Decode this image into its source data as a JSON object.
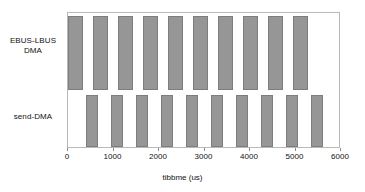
{
  "chart_data": {
    "type": "bar",
    "orientation": "horizontal-gantt",
    "title": "",
    "xlabel": "tibbme (us)",
    "ylabel": "",
    "xlim": [
      0,
      6000
    ],
    "xticks": [
      0,
      1000,
      2000,
      3000,
      4000,
      5000,
      6000
    ],
    "xticklabels": [
      "0",
      "1000",
      "2000",
      "3000",
      "4000",
      "5000",
      "6000"
    ],
    "grid": false,
    "legend": false,
    "categories": [
      "EBUS-LBUS\nDMA",
      "send-DMA"
    ],
    "series": [
      {
        "name": "EBUS-LBUS DMA",
        "row": 0,
        "bar_color": "#969696",
        "bar_edge_color": "#7d7d7d",
        "intervals": [
          {
            "start": 0,
            "end": 320
          },
          {
            "start": 550,
            "end": 870
          },
          {
            "start": 1100,
            "end": 1420
          },
          {
            "start": 1650,
            "end": 1970
          },
          {
            "start": 2200,
            "end": 2520
          },
          {
            "start": 2750,
            "end": 3070
          },
          {
            "start": 3300,
            "end": 3620
          },
          {
            "start": 3850,
            "end": 4170
          },
          {
            "start": 4400,
            "end": 4720
          },
          {
            "start": 4950,
            "end": 5270
          }
        ]
      },
      {
        "name": "send-DMA",
        "row": 1,
        "bar_color": "#969696",
        "bar_edge_color": "#7d7d7d",
        "intervals": [
          {
            "start": 390,
            "end": 660
          },
          {
            "start": 940,
            "end": 1210
          },
          {
            "start": 1490,
            "end": 1760
          },
          {
            "start": 2040,
            "end": 2310
          },
          {
            "start": 2590,
            "end": 2860
          },
          {
            "start": 3140,
            "end": 3410
          },
          {
            "start": 3690,
            "end": 3960
          },
          {
            "start": 4240,
            "end": 4510
          },
          {
            "start": 4790,
            "end": 5060
          },
          {
            "start": 5340,
            "end": 5610
          }
        ]
      }
    ]
  },
  "axis": {
    "x_title": "tibbme (us)"
  },
  "labels": {
    "row0": "EBUS-LBUS\nDMA",
    "row1": "send-DMA"
  }
}
